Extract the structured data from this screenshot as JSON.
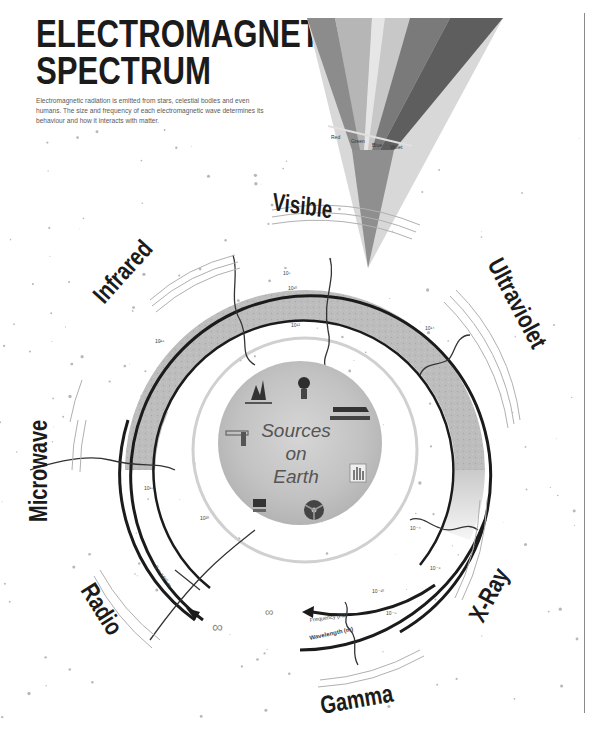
{
  "title_line1": "ELECTROMAGNETIC",
  "title_line2": "SPECTRUM",
  "intro": "Electromagnetic radiation is emitted from stars, celestial bodies and even humans. The size and frequency of each electromagnetic wave determines its behaviour and how it interacts with matter.",
  "center": {
    "line1": "Sources",
    "line2": "on",
    "line3": "Earth",
    "icons": [
      "campfire-icon",
      "light-bulb-icon",
      "tanning-bed-icon",
      "x-ray-hand-icon",
      "radiation-icon",
      "microwave-oven-icon",
      "remote-control-icon"
    ]
  },
  "bands": [
    {
      "name": "Radio",
      "blurb": "Radio waves are the longest waves, used to transmit signals over long distances."
    },
    {
      "name": "Microwave",
      "blurb": "Microwaves heat food and carry mobile phone and satellite signals."
    },
    {
      "name": "Infrared",
      "blurb": "Infrared radiation is felt as heat and is emitted by warm objects."
    },
    {
      "name": "Visible",
      "blurb": "The only part of the spectrum the human eye can detect, split into the colours of the rainbow."
    },
    {
      "name": "Ultraviolet",
      "blurb": "Ultraviolet light from the sun causes tanning and sunburn."
    },
    {
      "name": "X-Ray",
      "blurb": "X-rays pass through soft tissue and are used to image bones."
    },
    {
      "name": "Gamma",
      "blurb": "The most energetic waves, emitted by radioactive materials and nuclear reactions."
    }
  ],
  "rings": {
    "frequency_label": "Frequency (Hz)",
    "wavelength_label": "Wavelength (m)",
    "infinity_symbol": "∞",
    "radio_wavelength": "3 × 10¹⁰ m",
    "tick_labels": [
      "10⁸",
      "10¹⁰",
      "10¹²",
      "10¹⁴",
      "10¹⁶",
      "10¹⁸",
      "10²⁰",
      "10⁻¹⁰",
      "10⁻⁸",
      "10⁻⁶",
      "10⁻⁴"
    ]
  },
  "prism_labels": [
    "Red",
    "Green",
    "Blue",
    "Violet"
  ],
  "colors": {
    "ink": "#1b1b1b",
    "ring_fill": "#bdbdbd",
    "earth_fill": "#c9c9c9",
    "prism_dark": "#6f6f6f",
    "prism_light": "#cfcfcf"
  }
}
